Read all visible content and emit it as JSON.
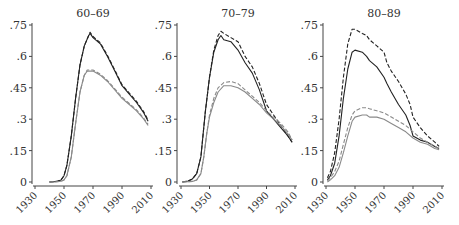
{
  "figure": {
    "panel_titles": [
      "60–69",
      "70–79",
      "80–89"
    ],
    "y_ticks": [
      ".75",
      ".6",
      ".45",
      ".3",
      ".15",
      "0"
    ],
    "x_ticks": [
      "1930",
      "1950",
      "1970",
      "1990",
      "2010"
    ]
  },
  "colors": {
    "dark_line": "#222222",
    "light_line": "#8a8a8a",
    "axis": "#444444",
    "text": "#333333"
  },
  "chart_data": [
    {
      "type": "line",
      "title": "60–69",
      "xlabel": "",
      "ylabel": "",
      "xlim": [
        1930,
        2010
      ],
      "ylim": [
        0,
        0.75
      ],
      "x_ticks": [
        1930,
        1950,
        1970,
        1990,
        2010
      ],
      "y_ticks": [
        0,
        0.15,
        0.3,
        0.45,
        0.6,
        0.75
      ],
      "grid": false,
      "series": [
        {
          "name": "dark solid",
          "style": "solid",
          "color": "dark",
          "x": [
            1940,
            1945,
            1948,
            1950,
            1952,
            1955,
            1958,
            1961,
            1964,
            1967,
            1968,
            1970,
            1975,
            1980,
            1985,
            1990,
            1995,
            2000,
            2005,
            2008
          ],
          "y": [
            0,
            0.003,
            0.01,
            0.03,
            0.08,
            0.22,
            0.4,
            0.56,
            0.65,
            0.7,
            0.71,
            0.69,
            0.66,
            0.6,
            0.53,
            0.46,
            0.42,
            0.38,
            0.33,
            0.29
          ]
        },
        {
          "name": "dark dashed",
          "style": "dashed",
          "color": "dark",
          "x": [
            1940,
            1945,
            1948,
            1950,
            1952,
            1955,
            1958,
            1961,
            1964,
            1967,
            1968,
            1970,
            1975,
            1980,
            1985,
            1990,
            1995,
            2000,
            2005,
            2008
          ],
          "y": [
            0,
            0.003,
            0.01,
            0.03,
            0.08,
            0.22,
            0.4,
            0.56,
            0.65,
            0.7,
            0.715,
            0.695,
            0.665,
            0.605,
            0.535,
            0.465,
            0.425,
            0.385,
            0.335,
            0.295
          ]
        },
        {
          "name": "light solid",
          "style": "solid",
          "color": "light",
          "x": [
            1940,
            1945,
            1948,
            1950,
            1952,
            1955,
            1958,
            1961,
            1964,
            1966,
            1970,
            1975,
            1980,
            1985,
            1990,
            1995,
            2000,
            2005,
            2008
          ],
          "y": [
            0,
            0.001,
            0.004,
            0.01,
            0.03,
            0.12,
            0.28,
            0.43,
            0.51,
            0.53,
            0.53,
            0.51,
            0.48,
            0.44,
            0.4,
            0.37,
            0.34,
            0.3,
            0.27
          ]
        },
        {
          "name": "light dashed",
          "style": "dashed",
          "color": "light",
          "x": [
            1940,
            1945,
            1948,
            1950,
            1952,
            1955,
            1958,
            1961,
            1964,
            1966,
            1970,
            1975,
            1980,
            1985,
            1990,
            1995,
            2000,
            2005,
            2008
          ],
          "y": [
            0,
            0.001,
            0.004,
            0.01,
            0.03,
            0.12,
            0.28,
            0.43,
            0.51,
            0.535,
            0.535,
            0.515,
            0.485,
            0.445,
            0.405,
            0.375,
            0.345,
            0.305,
            0.275
          ]
        }
      ]
    },
    {
      "type": "line",
      "title": "70–79",
      "xlabel": "",
      "ylabel": "",
      "xlim": [
        1930,
        2010
      ],
      "ylim": [
        0,
        0.75
      ],
      "x_ticks": [
        1930,
        1950,
        1970,
        1990,
        2010
      ],
      "y_ticks": [
        0,
        0.15,
        0.3,
        0.45,
        0.6,
        0.75
      ],
      "grid": false,
      "series": [
        {
          "name": "dark solid",
          "style": "solid",
          "color": "dark",
          "x": [
            1931,
            1935,
            1938,
            1941,
            1944,
            1947,
            1950,
            1953,
            1956,
            1958,
            1960,
            1965,
            1970,
            1975,
            1980,
            1985,
            1990,
            1995,
            2000,
            2005,
            2008
          ],
          "y": [
            0,
            0.005,
            0.015,
            0.04,
            0.12,
            0.33,
            0.5,
            0.62,
            0.68,
            0.7,
            0.68,
            0.67,
            0.63,
            0.57,
            0.52,
            0.44,
            0.34,
            0.3,
            0.26,
            0.22,
            0.19
          ]
        },
        {
          "name": "dark dashed",
          "style": "dashed",
          "color": "dark",
          "x": [
            1931,
            1935,
            1938,
            1941,
            1944,
            1947,
            1950,
            1953,
            1956,
            1958,
            1960,
            1965,
            1970,
            1975,
            1980,
            1985,
            1990,
            1995,
            2000,
            2005,
            2008
          ],
          "y": [
            0,
            0.005,
            0.015,
            0.04,
            0.12,
            0.33,
            0.5,
            0.63,
            0.7,
            0.72,
            0.71,
            0.69,
            0.67,
            0.6,
            0.55,
            0.47,
            0.37,
            0.32,
            0.27,
            0.22,
            0.19
          ]
        },
        {
          "name": "light solid",
          "style": "solid",
          "color": "light",
          "x": [
            1931,
            1935,
            1938,
            1941,
            1944,
            1946,
            1948,
            1950,
            1953,
            1956,
            1960,
            1965,
            1970,
            1975,
            1980,
            1985,
            1990,
            1995,
            2000,
            2005,
            2008
          ],
          "y": [
            0,
            0.001,
            0.003,
            0.01,
            0.04,
            0.12,
            0.23,
            0.31,
            0.38,
            0.43,
            0.46,
            0.46,
            0.45,
            0.43,
            0.4,
            0.37,
            0.33,
            0.3,
            0.27,
            0.23,
            0.2
          ]
        },
        {
          "name": "light dashed",
          "style": "dashed",
          "color": "light",
          "x": [
            1931,
            1935,
            1938,
            1941,
            1944,
            1946,
            1948,
            1950,
            1953,
            1956,
            1960,
            1965,
            1970,
            1975,
            1980,
            1985,
            1990,
            1995,
            2000,
            2005,
            2008
          ],
          "y": [
            0,
            0.001,
            0.003,
            0.01,
            0.04,
            0.12,
            0.23,
            0.32,
            0.4,
            0.45,
            0.475,
            0.48,
            0.47,
            0.44,
            0.41,
            0.38,
            0.34,
            0.31,
            0.28,
            0.24,
            0.2
          ]
        }
      ]
    },
    {
      "type": "line",
      "title": "80–89",
      "xlabel": "",
      "ylabel": "",
      "xlim": [
        1930,
        2010
      ],
      "ylim": [
        0,
        0.75
      ],
      "x_ticks": [
        1930,
        1950,
        1970,
        1990,
        2010
      ],
      "y_ticks": [
        0,
        0.15,
        0.3,
        0.45,
        0.6,
        0.75
      ],
      "grid": false,
      "series": [
        {
          "name": "dark solid",
          "style": "solid",
          "color": "dark",
          "x": [
            1931,
            1933,
            1936,
            1939,
            1942,
            1945,
            1948,
            1950,
            1955,
            1958,
            1960,
            1965,
            1970,
            1972,
            1975,
            1980,
            1985,
            1988,
            1990,
            1995,
            2000,
            2005,
            2008
          ],
          "y": [
            0.01,
            0.03,
            0.09,
            0.22,
            0.4,
            0.54,
            0.62,
            0.63,
            0.62,
            0.6,
            0.58,
            0.55,
            0.5,
            0.47,
            0.43,
            0.37,
            0.32,
            0.27,
            0.22,
            0.2,
            0.19,
            0.17,
            0.16
          ]
        },
        {
          "name": "dark dashed",
          "style": "dashed",
          "color": "dark",
          "x": [
            1931,
            1933,
            1936,
            1939,
            1942,
            1945,
            1948,
            1950,
            1955,
            1958,
            1960,
            1965,
            1970,
            1972,
            1975,
            1980,
            1985,
            1988,
            1990,
            1995,
            2000,
            2005,
            2008
          ],
          "y": [
            0.02,
            0.05,
            0.14,
            0.3,
            0.5,
            0.66,
            0.73,
            0.73,
            0.71,
            0.7,
            0.68,
            0.65,
            0.62,
            0.57,
            0.53,
            0.48,
            0.42,
            0.37,
            0.31,
            0.26,
            0.22,
            0.19,
            0.17
          ]
        },
        {
          "name": "light solid",
          "style": "solid",
          "color": "light",
          "x": [
            1931,
            1933,
            1936,
            1939,
            1942,
            1945,
            1948,
            1950,
            1955,
            1958,
            1960,
            1965,
            1970,
            1975,
            1980,
            1985,
            1990,
            1995,
            2000,
            2005,
            2008
          ],
          "y": [
            0,
            0.01,
            0.03,
            0.07,
            0.14,
            0.22,
            0.29,
            0.31,
            0.32,
            0.32,
            0.31,
            0.31,
            0.3,
            0.28,
            0.26,
            0.24,
            0.21,
            0.19,
            0.18,
            0.16,
            0.155
          ]
        },
        {
          "name": "light dashed",
          "style": "dashed",
          "color": "light",
          "x": [
            1931,
            1933,
            1936,
            1939,
            1942,
            1945,
            1948,
            1950,
            1955,
            1958,
            1960,
            1965,
            1970,
            1975,
            1980,
            1985,
            1990,
            1995,
            2000,
            2005,
            2008
          ],
          "y": [
            0.005,
            0.02,
            0.05,
            0.1,
            0.18,
            0.26,
            0.32,
            0.34,
            0.355,
            0.355,
            0.35,
            0.34,
            0.33,
            0.31,
            0.29,
            0.27,
            0.24,
            0.21,
            0.19,
            0.17,
            0.16
          ]
        }
      ]
    }
  ]
}
